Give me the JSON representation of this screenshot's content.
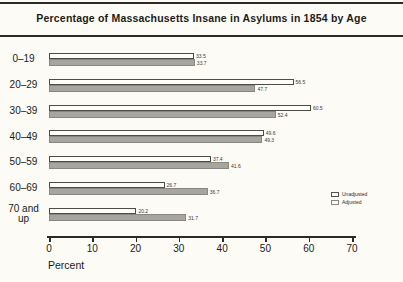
{
  "title": "Percentage of Massachusetts Insane in Asylums in 1854 by Age",
  "chart_data": {
    "type": "bar",
    "orientation": "horizontal",
    "title": "Percentage of Massachusetts Insane in Asylums in 1854 by Age",
    "categories": [
      "0–19",
      "20–29",
      "30–39",
      "40–49",
      "50–59",
      "60–69",
      "70 and up"
    ],
    "series": [
      {
        "name": "Unadjusted",
        "color": "#fdfdf9",
        "values": [
          33.5,
          56.5,
          60.5,
          49.6,
          37.4,
          26.7,
          20.2
        ]
      },
      {
        "name": "Adjusted",
        "color": "#a6a5a0",
        "values": [
          33.7,
          47.7,
          52.4,
          49.3,
          41.6,
          36.7,
          31.7
        ]
      }
    ],
    "xlabel": "Percent",
    "xlim": [
      0,
      70
    ],
    "xticks": [
      0,
      10,
      20,
      30,
      40,
      50,
      60,
      70
    ],
    "grid": false,
    "legend_position": "right"
  },
  "legend": {
    "items": [
      {
        "label": "Unadjusted",
        "color": "#fdfdf9"
      },
      {
        "label": "Adjusted",
        "color": "#a6a5a0"
      }
    ]
  }
}
